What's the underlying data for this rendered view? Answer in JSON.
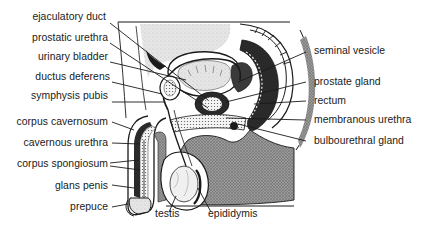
{
  "diagram": {
    "type": "anatomical-illustration",
    "colors": {
      "ink": "#1a1a1a",
      "stipple_gray": "#8a8a8a",
      "light_gray": "#d4d4d4",
      "background": "#ffffff"
    },
    "labels_left": [
      {
        "id": "ejaculatory-duct",
        "text": "ejaculatory duct"
      },
      {
        "id": "prostatic-urethra",
        "text": "prostatic urethra"
      },
      {
        "id": "urinary-bladder",
        "text": "urinary bladder"
      },
      {
        "id": "ductus-deferens",
        "text": "ductus deferens"
      },
      {
        "id": "symphysis-pubis",
        "text": "symphysis pubis"
      },
      {
        "id": "corpus-cavernosum",
        "text": "corpus cavernosum"
      },
      {
        "id": "cavernous-urethra",
        "text": "cavernous urethra"
      },
      {
        "id": "corpus-spongiosum",
        "text": "corpus spongiosum"
      },
      {
        "id": "glans-penis",
        "text": "glans penis"
      },
      {
        "id": "prepuce",
        "text": "prepuce"
      }
    ],
    "labels_right": [
      {
        "id": "seminal-vesicle",
        "text": "seminal vesicle"
      },
      {
        "id": "prostate-gland",
        "text": "prostate gland"
      },
      {
        "id": "rectum",
        "text": "rectum"
      },
      {
        "id": "membranous-urethra",
        "text": "membranous urethra"
      },
      {
        "id": "bulbourethral-gland",
        "text": "bulbourethral gland"
      }
    ],
    "labels_bottom": [
      {
        "id": "testis",
        "text": "testis"
      },
      {
        "id": "epididymis",
        "text": "epididymis"
      }
    ]
  }
}
